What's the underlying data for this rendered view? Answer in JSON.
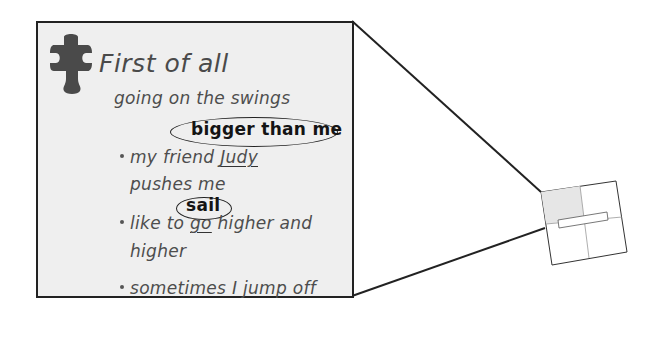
{
  "panel": {
    "heading": "First of all",
    "icon": "puzzle-piece-icon",
    "lines": [
      {
        "text": "going on the swings",
        "bullet": false
      },
      {
        "text": "bigger than me",
        "annotation": "circled",
        "style": "bold"
      },
      {
        "prefix": "my friend ",
        "underlined": "Judy",
        "bullet": true
      },
      {
        "text": "pushes me",
        "bullet": false
      },
      {
        "text": "sail",
        "annotation": "circled",
        "style": "bold"
      },
      {
        "prefix": "like to ",
        "underlined": "go",
        "suffix": " higher and",
        "bullet": true
      },
      {
        "text": "higher",
        "bullet": false
      },
      {
        "text": "sometimes I jump off",
        "bullet": true
      }
    ]
  },
  "thumbnail": {
    "description": "small rotated page with four quadrants; top-left quadrant shaded, horizontal bar across center",
    "shaded_color": "#e6e6e6"
  },
  "colors": {
    "panel_fill": "#efefef",
    "border": "#222222",
    "text": "#4d4d4d",
    "icon": "#4a4a4a"
  }
}
